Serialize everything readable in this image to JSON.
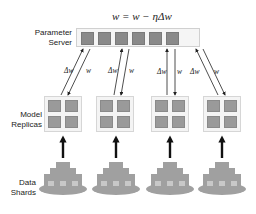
{
  "formula": "w = w − ηΔw",
  "labels": {
    "parameter_server": [
      "Parameter",
      "Server"
    ],
    "model_replicas": [
      "Model",
      "Replicas"
    ],
    "data_shards": [
      "Data",
      "Shards"
    ]
  },
  "parameter_server": {
    "shard_count": 6
  },
  "replicas": [
    {
      "id": 1,
      "up_label": "Δw",
      "down_label": "w"
    },
    {
      "id": 2,
      "up_label": "Δw",
      "down_label": "w"
    },
    {
      "id": 3,
      "up_label": "Δw",
      "down_label": "w"
    },
    {
      "id": 4,
      "up_label": "Δw",
      "down_label": "w"
    }
  ],
  "colors": {
    "block": "#8a8a8a",
    "box_bg": "#f4f4f4",
    "shard": "#999999"
  }
}
